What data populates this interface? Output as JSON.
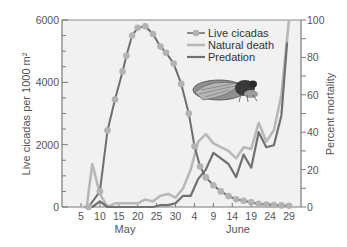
{
  "chart_data": {
    "type": "line",
    "title": "",
    "xlabel": "",
    "x_groups": [
      "May",
      "June"
    ],
    "x_ticks": [
      "5",
      "10",
      "15",
      "20",
      "25",
      "30",
      "4",
      "9",
      "14",
      "19",
      "24",
      "29"
    ],
    "y_left": {
      "label": "Live cicadas per 1000 m²",
      "ticks": [
        0,
        2000,
        4000,
        6000
      ],
      "range": [
        0,
        6000
      ]
    },
    "y_right": {
      "label": "Percent mortality",
      "ticks": [
        0,
        20,
        40,
        60,
        80,
        100
      ],
      "range": [
        0,
        100
      ]
    },
    "grid": false,
    "legend_position": "top-right inside",
    "series": [
      {
        "name": "Live cicadas",
        "axis": "left",
        "style": "dark line with light dot markers",
        "points": [
          [
            7,
            0
          ],
          [
            10,
            500
          ],
          [
            12,
            2450
          ],
          [
            14,
            3450
          ],
          [
            16,
            4350
          ],
          [
            17,
            4850
          ],
          [
            18.5,
            5500
          ],
          [
            20,
            5750
          ],
          [
            22,
            5800
          ],
          [
            24,
            5550
          ],
          [
            26,
            5150
          ],
          [
            27.5,
            4950
          ],
          [
            29.5,
            4600
          ],
          [
            31.5,
            3950
          ],
          [
            33.5,
            3000
          ],
          [
            35,
            1950
          ],
          [
            36.5,
            1300
          ],
          [
            38,
            950
          ],
          [
            40,
            700
          ],
          [
            42,
            500
          ],
          [
            44,
            350
          ],
          [
            46,
            250
          ],
          [
            48,
            200
          ],
          [
            50,
            150
          ],
          [
            52,
            100
          ],
          [
            54,
            80
          ],
          [
            56,
            60
          ],
          [
            58,
            50
          ],
          [
            60,
            40
          ]
        ]
      },
      {
        "name": "Natural death",
        "axis": "right",
        "style": "light gray line",
        "points": [
          [
            5,
            0
          ],
          [
            6.5,
            0
          ],
          [
            8,
            23
          ],
          [
            10,
            7
          ],
          [
            12,
            0
          ],
          [
            14,
            2
          ],
          [
            16,
            2
          ],
          [
            18,
            2
          ],
          [
            20,
            2
          ],
          [
            22,
            4
          ],
          [
            24,
            3
          ],
          [
            26,
            6
          ],
          [
            28,
            7
          ],
          [
            30,
            5
          ],
          [
            32,
            10
          ],
          [
            34,
            20
          ],
          [
            36,
            35
          ],
          [
            38,
            39
          ],
          [
            40,
            34
          ],
          [
            42,
            32
          ],
          [
            44,
            30
          ],
          [
            46,
            26
          ],
          [
            48,
            32
          ],
          [
            50,
            31
          ],
          [
            52,
            45
          ],
          [
            54,
            35
          ],
          [
            56,
            41
          ],
          [
            58,
            60
          ],
          [
            60,
            100
          ]
        ]
      },
      {
        "name": "Predation",
        "axis": "right",
        "style": "dark gray line",
        "points": [
          [
            6,
            0
          ],
          [
            8,
            0
          ],
          [
            10,
            3
          ],
          [
            12,
            0
          ],
          [
            20,
            0
          ],
          [
            24,
            0
          ],
          [
            26,
            1
          ],
          [
            28,
            1
          ],
          [
            30,
            2
          ],
          [
            32,
            6
          ],
          [
            34,
            6
          ],
          [
            36,
            15
          ],
          [
            38,
            20
          ],
          [
            40,
            29
          ],
          [
            42,
            26
          ],
          [
            44,
            23
          ],
          [
            46,
            16
          ],
          [
            48,
            28
          ],
          [
            50,
            21
          ],
          [
            52,
            40
          ],
          [
            54,
            32
          ],
          [
            56,
            33
          ],
          [
            58,
            49
          ],
          [
            59.5,
            88
          ]
        ]
      }
    ],
    "annotations": [
      "cicada illustration"
    ]
  },
  "legend": {
    "items": [
      {
        "label": "Live cicadas",
        "color": "#7a7a7a"
      },
      {
        "label": "Natural death",
        "color": "#b8b8b8"
      },
      {
        "label": "Predation",
        "color": "#6e6e6e"
      }
    ]
  },
  "colors": {
    "live_line": "#6e6e6e",
    "live_marker": "#b3b3b3",
    "natural": "#b8b8b8",
    "predation": "#707070",
    "plot_bg": "#f1f1f1",
    "axis": "#7a7a7a"
  }
}
